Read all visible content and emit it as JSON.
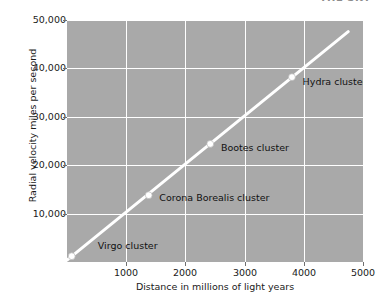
{
  "header": {
    "cut_off_text": "THE SKY"
  },
  "chart_data": {
    "type": "scatter",
    "title": "",
    "xlabel": "Distance in millions of light years",
    "ylabel": "Radial velocity miles per second",
    "xlim": [
      0,
      5000
    ],
    "ylim": [
      0,
      50000
    ],
    "xticks": [
      1000,
      2000,
      3000,
      4000,
      5000
    ],
    "xtick_labels": [
      "1000",
      "2000",
      "3000",
      "4000",
      "5000"
    ],
    "yticks": [
      10000,
      20000,
      30000,
      40000,
      50000
    ],
    "ytick_labels": [
      "10,000",
      "20,000",
      "30,000",
      "40,000",
      "50,000"
    ],
    "y_minor_ticks": [
      5000,
      15000,
      25000,
      35000,
      45000
    ],
    "grid": true,
    "grid_color": "#ffffff",
    "plot_background": "#a9a9a9",
    "line_color": "#ffffff",
    "marker_color": "#ffffff",
    "points": [
      {
        "name": "Virgo cluster",
        "x": 80,
        "y": 1200
      },
      {
        "name": "Corona Borealis cluster",
        "x": 1380,
        "y": 13800
      },
      {
        "name": "Bootes cluster",
        "x": 2420,
        "y": 24400
      },
      {
        "name": "Hydra cluster",
        "x": 3800,
        "y": 38200
      }
    ],
    "trendline": {
      "x0": 0,
      "y0": 400,
      "x1": 4750,
      "y1": 47600
    },
    "annotations": [
      {
        "label": "Virgo cluster",
        "x": 520,
        "y": 3400
      },
      {
        "label": "Corona Borealis cluster",
        "x": 1560,
        "y": 13200
      },
      {
        "label": "Bootes cluster",
        "x": 2600,
        "y": 23600
      },
      {
        "label": "Hydra cluster",
        "x": 3980,
        "y": 37200
      }
    ]
  }
}
